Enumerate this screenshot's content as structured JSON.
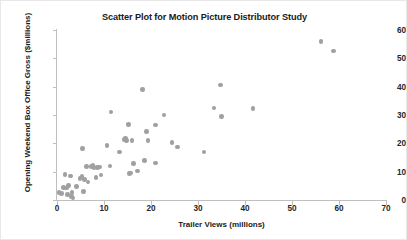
{
  "chart_data": {
    "type": "scatter",
    "title": "Scatter Plot for Motion Picture Distributor Study",
    "xlabel": "Trailer Views (millions)",
    "ylabel": "Opening Weekend Box Office Gross ($millions)",
    "xlim": [
      0,
      70
    ],
    "ylim": [
      0,
      60
    ],
    "xticks": [
      0,
      10,
      20,
      30,
      40,
      50,
      60,
      70
    ],
    "yticks": [
      0,
      10,
      20,
      30,
      40,
      50,
      60
    ],
    "xtick_labels": [
      "0",
      "10",
      "20",
      "30",
      "40",
      "50",
      "60",
      "70"
    ],
    "ytick_labels": [
      "0",
      "10",
      "20",
      "30",
      "40",
      "50",
      "60"
    ],
    "grid": false,
    "legend": false,
    "marker_color": "#a0a0a0",
    "series": [
      {
        "name": "Motion pictures",
        "points": [
          [
            0.4,
            2.6
          ],
          [
            1.0,
            2.3
          ],
          [
            1.4,
            4.5
          ],
          [
            1.7,
            9.0
          ],
          [
            2.0,
            4.2
          ],
          [
            2.2,
            1.9
          ],
          [
            2.5,
            5.1
          ],
          [
            2.8,
            8.4
          ],
          [
            3.0,
            8.5
          ],
          [
            3.1,
            1.2
          ],
          [
            3.2,
            2.6
          ],
          [
            3.4,
            0.7
          ],
          [
            4.1,
            4.8
          ],
          [
            4.9,
            7.6
          ],
          [
            5.3,
            8.2
          ],
          [
            5.4,
            18.1
          ],
          [
            5.6,
            3.1
          ],
          [
            5.9,
            7.2
          ],
          [
            6.3,
            11.8
          ],
          [
            6.6,
            6.4
          ],
          [
            7.4,
            11.9
          ],
          [
            7.7,
            12.1
          ],
          [
            7.9,
            11.5
          ],
          [
            8.3,
            8.0
          ],
          [
            8.6,
            11.4
          ],
          [
            9.1,
            11.6
          ],
          [
            9.4,
            8.8
          ],
          [
            10.6,
            19.2
          ],
          [
            11.3,
            12.0
          ],
          [
            11.5,
            31.0
          ],
          [
            13.3,
            16.9
          ],
          [
            14.4,
            21.3
          ],
          [
            14.6,
            21.8
          ],
          [
            14.8,
            20.9
          ],
          [
            15.2,
            26.7
          ],
          [
            15.4,
            9.4
          ],
          [
            15.7,
            9.6
          ],
          [
            16.0,
            20.9
          ],
          [
            16.3,
            12.9
          ],
          [
            17.1,
            10.2
          ],
          [
            18.2,
            38.9
          ],
          [
            18.6,
            13.9
          ],
          [
            19.0,
            24.2
          ],
          [
            19.4,
            21.1
          ],
          [
            20.9,
            26.5
          ],
          [
            21.0,
            13.1
          ],
          [
            22.8,
            30.0
          ],
          [
            24.5,
            20.2
          ],
          [
            25.6,
            18.7
          ],
          [
            31.3,
            17.0
          ],
          [
            33.4,
            32.5
          ],
          [
            34.8,
            40.6
          ],
          [
            35.0,
            29.5
          ],
          [
            41.7,
            32.3
          ],
          [
            56.2,
            55.9
          ],
          [
            58.8,
            52.6
          ]
        ]
      }
    ]
  }
}
